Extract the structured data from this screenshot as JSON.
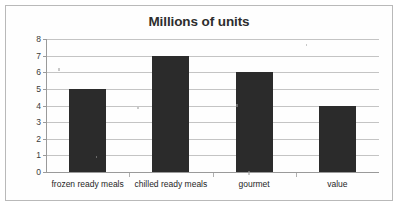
{
  "chart_data": {
    "type": "bar",
    "title": "Millions of units",
    "xlabel": "",
    "ylabel": "",
    "categories": [
      "frozen ready meals",
      "chilled ready meals",
      "gourmet",
      "value"
    ],
    "values": [
      5,
      7,
      6,
      4
    ],
    "ylim": [
      0,
      8
    ],
    "ytick_labels": [
      "0",
      "1",
      "2",
      "3",
      "4",
      "5",
      "6",
      "7",
      "8"
    ],
    "ytick_values": [
      0,
      1,
      2,
      3,
      4,
      5,
      6,
      7,
      8
    ],
    "grid": true,
    "legend": false,
    "legend_position": "none",
    "series": [
      {
        "name": "Millions of units",
        "values": [
          5,
          7,
          6,
          4
        ]
      }
    ]
  },
  "colors": {
    "bar": "#2b2b2b",
    "gridline": "#c4c4c4",
    "axis": "#9a9a9a",
    "frame_border": "#b9b9b9",
    "background": "#fefefe",
    "title_text": "#2d2d2d",
    "tick_text": "#3a3a3a"
  }
}
